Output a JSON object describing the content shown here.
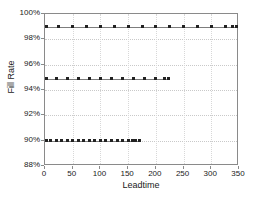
{
  "chart_data": {
    "type": "line",
    "title": "",
    "xlabel": "Leadtime",
    "ylabel": "Fill Rate",
    "xlim": [
      0,
      350
    ],
    "ylim": [
      88,
      100
    ],
    "xticks": [
      0,
      50,
      100,
      150,
      200,
      250,
      300,
      350
    ],
    "xtick_labels": [
      "0",
      "50",
      "100",
      "150",
      "200",
      "250",
      "300",
      "350"
    ],
    "yticks": [
      88,
      90,
      92,
      94,
      96,
      98,
      100
    ],
    "ytick_labels": [
      "88%",
      "90%",
      "92%",
      "94%",
      "96%",
      "98%",
      "100%"
    ],
    "grid": true,
    "legend": "none",
    "marker": "square",
    "line_color": "#7d7d7d",
    "marker_color": "#222222",
    "series": [
      {
        "name": "99% fill rate",
        "value": 99,
        "x": [
          2,
          25,
          50,
          75,
          100,
          125,
          150,
          175,
          200,
          225,
          250,
          275,
          300,
          325,
          338,
          345
        ],
        "values": [
          99,
          99,
          99,
          99,
          99,
          99,
          99,
          99,
          99,
          99,
          99,
          99,
          99,
          99,
          99,
          99
        ]
      },
      {
        "name": "95% fill rate",
        "value": 94.9,
        "x": [
          2,
          20,
          40,
          60,
          80,
          100,
          120,
          140,
          160,
          180,
          200,
          215,
          222
        ],
        "values": [
          94.9,
          94.9,
          94.9,
          94.9,
          94.9,
          94.9,
          94.9,
          94.9,
          94.9,
          94.9,
          94.9,
          94.9,
          94.9
        ]
      },
      {
        "name": "90% fill rate",
        "value": 90,
        "x": [
          2,
          10,
          20,
          30,
          40,
          50,
          60,
          70,
          80,
          90,
          100,
          110,
          120,
          130,
          140,
          150,
          158,
          164,
          170
        ],
        "values": [
          90,
          90,
          90,
          90,
          90,
          90,
          90,
          90,
          90,
          90,
          90,
          90,
          90,
          90,
          90,
          90,
          90,
          90,
          90
        ]
      }
    ]
  }
}
